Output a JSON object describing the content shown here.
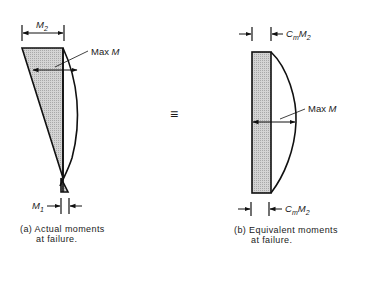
{
  "figure": {
    "equivalence_symbol": "≡",
    "colors": {
      "line": "#111111",
      "hatch_fill": "#c8c8c8",
      "background": "#ffffff"
    }
  },
  "panel_a": {
    "top_dimension": {
      "base": "M",
      "sub": "2"
    },
    "max_label": {
      "text": "Max ",
      "var": "M"
    },
    "bottom_dimension": {
      "base": "M",
      "sub": "1"
    },
    "caption_line1": "(a)  Actual moments",
    "caption_line2": "at failure."
  },
  "panel_b": {
    "top_dimension": {
      "coef": "C",
      "coef_sub": "m",
      "base": "M",
      "sub": "2"
    },
    "max_label": {
      "text": "Max ",
      "var": "M"
    },
    "bottom_dimension": {
      "coef": "C",
      "coef_sub": "m",
      "base": "M",
      "sub": "2"
    },
    "caption_line1": "(b)  Equivalent moments",
    "caption_line2": "at failure."
  }
}
